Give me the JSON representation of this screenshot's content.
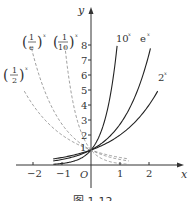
{
  "figure": {
    "caption": "图 1-12",
    "axes": {
      "x_label": "x",
      "y_label": "y",
      "origin_label": "O",
      "x_ticks": [
        "−2",
        "−1",
        "1",
        "2"
      ],
      "y_ticks": [
        "1",
        "2",
        "3",
        "4",
        "5",
        "6",
        "7",
        "8"
      ]
    },
    "curves": [
      {
        "label": "10",
        "exp": "x",
        "style": "solid",
        "color": "#222222"
      },
      {
        "label": "e",
        "exp": "x",
        "style": "solid",
        "color": "#222222"
      },
      {
        "label": "2",
        "exp": "x",
        "style": "solid",
        "color": "#222222"
      },
      {
        "label_num": "1",
        "label_den": "e",
        "exp": "x",
        "style": "dashed",
        "color": "#888888"
      },
      {
        "label_num": "1",
        "label_den": "10",
        "exp": "x",
        "style": "dashed",
        "color": "#888888"
      },
      {
        "label_num": "1",
        "label_den": "2",
        "exp": "x",
        "style": "dashed",
        "color": "#888888"
      }
    ]
  },
  "chart_data": {
    "type": "line",
    "title": "",
    "xlabel": "x",
    "ylabel": "y",
    "xlim": [
      -2.3,
      2.9
    ],
    "ylim": [
      0,
      9
    ],
    "grid": false,
    "series": [
      {
        "name": "10^x",
        "style": "solid",
        "x": [
          -1.3,
          -1,
          0,
          0.5,
          0.9
        ],
        "values": [
          0.05,
          0.1,
          1,
          3.16,
          7.94
        ]
      },
      {
        "name": "e^x",
        "style": "solid",
        "x": [
          -1.3,
          -1,
          0,
          1,
          2.05
        ],
        "values": [
          0.27,
          0.37,
          1,
          2.72,
          7.77
        ]
      },
      {
        "name": "2^x",
        "style": "solid",
        "x": [
          -1.3,
          -1,
          0,
          1,
          2.3
        ],
        "values": [
          0.41,
          0.5,
          1,
          2,
          4.92
        ]
      },
      {
        "name": "(1/e)^x",
        "style": "dashed",
        "x": [
          -2.05,
          -1,
          0,
          1,
          1.3
        ],
        "values": [
          7.77,
          2.72,
          1,
          0.37,
          0.27
        ]
      },
      {
        "name": "(1/10)^x",
        "style": "dashed",
        "x": [
          -0.9,
          -0.5,
          0,
          1,
          1.3
        ],
        "values": [
          7.94,
          3.16,
          1,
          0.1,
          0.05
        ]
      },
      {
        "name": "(1/2)^x",
        "style": "dashed",
        "x": [
          -2.3,
          -1,
          0,
          1,
          1.3
        ],
        "values": [
          4.92,
          2,
          1,
          0.5,
          0.41
        ]
      }
    ]
  }
}
